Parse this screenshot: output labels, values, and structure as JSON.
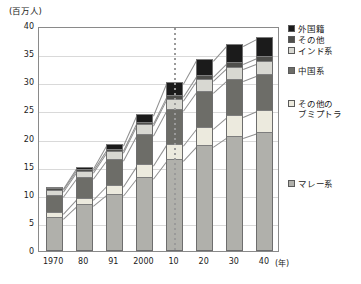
{
  "chart_data": {
    "type": "bar",
    "title": "",
    "subtitle": "",
    "unit_label": "(百万人)",
    "xlabel": "(年)",
    "ylabel": "",
    "stacked": true,
    "grid": true,
    "legend_position": "right",
    "ylim": [
      0,
      40
    ],
    "ytick_step": 5,
    "ytick_labels": [
      "40",
      "35",
      "30",
      "25",
      "20",
      "15",
      "10",
      "5",
      "0"
    ],
    "ytick_values": [
      40,
      35,
      30,
      25,
      20,
      15,
      10,
      5,
      0
    ],
    "categories": [
      "1970",
      "80",
      "91",
      "2000",
      "10",
      "20",
      "30",
      "40"
    ],
    "annotations": [
      {
        "name": "projection-divider",
        "at_category": "10",
        "style": "dotted-vertical-line"
      }
    ],
    "series": [
      {
        "name": "マレー系",
        "color": "#b0b0ab",
        "values": [
          6.1,
          8.3,
          10.2,
          13.2,
          16.3,
          18.8,
          20.4,
          21.2
        ]
      },
      {
        "name": "その他のブミプトラ",
        "color": "#eceade",
        "values": [
          0.8,
          1.1,
          1.6,
          2.2,
          2.8,
          3.3,
          3.7,
          3.9
        ]
      },
      {
        "name": "中国系",
        "color": "#6d6d68",
        "values": [
          3.1,
          3.8,
          4.6,
          5.4,
          6.1,
          6.4,
          6.5,
          6.4
        ]
      },
      {
        "name": "インド系",
        "color": "#d8d8d2",
        "values": [
          0.9,
          1.1,
          1.4,
          1.7,
          1.9,
          2.1,
          2.2,
          2.2
        ]
      },
      {
        "name": "その他",
        "color": "#4f4f4c",
        "values": [
          0.3,
          0.3,
          0.4,
          0.5,
          0.6,
          0.7,
          0.8,
          0.9
        ]
      },
      {
        "name": "外国籍",
        "color": "#1b1b1b",
        "values": [
          0.1,
          0.3,
          0.8,
          1.3,
          2.3,
          2.9,
          3.2,
          3.4
        ]
      }
    ],
    "totals": [
      11.3,
      14.9,
      19.0,
      24.3,
      30.0,
      34.2,
      36.8,
      38.0
    ]
  },
  "legend": {
    "items": [
      {
        "label": "外国籍",
        "color": "#1b1b1b"
      },
      {
        "label": "その他",
        "color": "#4f4f4c"
      },
      {
        "label": "インド系",
        "color": "#d8d8d2"
      },
      {
        "label": "中国系",
        "color": "#6d6d68"
      },
      {
        "label": "その他の",
        "color": "#eceade"
      },
      {
        "label": "ブミプトラ",
        "color": null
      },
      {
        "label": "マレー系",
        "color": "#b0b0ab"
      }
    ]
  }
}
